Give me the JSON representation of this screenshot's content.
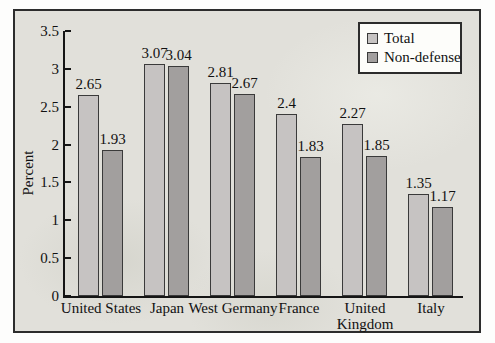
{
  "chart_data": {
    "type": "bar",
    "title": "",
    "ylabel": "Percent",
    "xlabel": "",
    "ylim": [
      0,
      3.5
    ],
    "ytick_step": 0.5,
    "grid": false,
    "legend_position": "top-right",
    "categories": [
      "United States",
      "Japan",
      "West Germany",
      "France",
      "United Kingdom",
      "Italy"
    ],
    "series": [
      {
        "name": "Total",
        "color": "#c6c3c2",
        "values": [
          2.65,
          3.07,
          2.81,
          2.4,
          2.27,
          1.35
        ],
        "labels": [
          "2.65",
          "3.07",
          "2.81",
          "2.4",
          "2.27",
          "1.35"
        ]
      },
      {
        "name": "Non-defense",
        "color": "#a29f9e",
        "values": [
          1.93,
          3.04,
          2.67,
          1.83,
          1.85,
          1.17
        ],
        "labels": [
          "1.93",
          "3.04",
          "2.67",
          "1.83",
          "1.85",
          "1.17"
        ]
      }
    ],
    "colors": {
      "panel_background": "#e1e0da",
      "panel_border": "#2c2c2c",
      "axis": "#151515",
      "text": "#111111",
      "legend_background": "#fdfdfa"
    }
  }
}
